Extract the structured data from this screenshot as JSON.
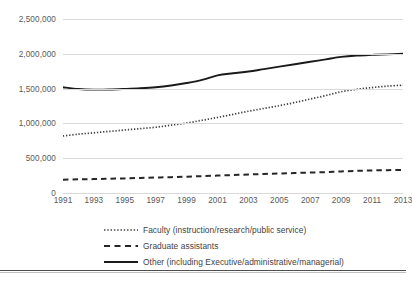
{
  "chart_data": {
    "type": "line",
    "title": "",
    "subtitle": "",
    "xlabel": "",
    "ylabel": "",
    "x": [
      1991,
      1992,
      1993,
      1994,
      1995,
      1996,
      1997,
      1998,
      1999,
      2000,
      2001,
      2002,
      2003,
      2004,
      2005,
      2006,
      2007,
      2008,
      2009,
      2010,
      2011,
      2012,
      2013
    ],
    "xtick_labels": [
      "1991",
      "1993",
      "1995",
      "1997",
      "1999",
      "2001",
      "2003",
      "2005",
      "2007",
      "2009",
      "2011",
      "2013"
    ],
    "xtick_values": [
      1991,
      1993,
      1995,
      1997,
      1999,
      2001,
      2003,
      2005,
      2007,
      2009,
      2011,
      2013
    ],
    "ytick_labels": [
      "0",
      "500,000",
      "1,000,000",
      "1,500,000",
      "2,000,000",
      "2,500,000"
    ],
    "ytick_values": [
      0,
      500000,
      1000000,
      1500000,
      2000000,
      2500000
    ],
    "ylim": [
      0,
      2500000
    ],
    "xlim": [
      1991,
      2013
    ],
    "grid": "horizontal",
    "legend_position": "bottom",
    "series": [
      {
        "name": "Faculty (instruction/research/public service)",
        "style": "dotted",
        "color": "#3f3f3f",
        "values": [
          820000,
          845000,
          865000,
          885000,
          905000,
          925000,
          945000,
          975000,
          1005000,
          1045000,
          1085000,
          1130000,
          1175000,
          1215000,
          1255000,
          1300000,
          1350000,
          1400000,
          1455000,
          1490000,
          1515000,
          1535000,
          1550000
        ]
      },
      {
        "name": "Graduate assistants",
        "style": "dashed",
        "color": "#262626",
        "values": [
          192000,
          196000,
          200000,
          205000,
          210000,
          216000,
          222000,
          228000,
          235000,
          242000,
          250000,
          258000,
          266000,
          273000,
          280000,
          287000,
          294000,
          300000,
          310000,
          318000,
          324000,
          328000,
          332000
        ]
      },
      {
        "name": "Other (including Executive/administrative/managerial)",
        "style": "solid",
        "color": "#1a1a1a",
        "values": [
          1520000,
          1495000,
          1485000,
          1487000,
          1495000,
          1505000,
          1520000,
          1545000,
          1580000,
          1625000,
          1690000,
          1720000,
          1745000,
          1780000,
          1815000,
          1850000,
          1885000,
          1920000,
          1955000,
          1975000,
          1985000,
          1992000,
          2000000
        ]
      }
    ]
  },
  "legend": {
    "items": [
      {
        "label": "Faculty (instruction/research/public service)",
        "marker": "dotted-line-marker"
      },
      {
        "label": "Graduate assistants",
        "marker": "dashed-line-marker"
      },
      {
        "label": "Other (including Executive/administrative/managerial)",
        "marker": "solid-line-marker"
      }
    ]
  }
}
